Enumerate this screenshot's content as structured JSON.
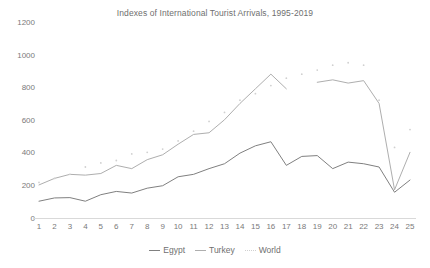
{
  "chart_data": {
    "type": "line",
    "title": "Indexes of International Tourist Arrivals, 1995-2019",
    "xlabel": "",
    "ylabel": "",
    "xlim": [
      1,
      25
    ],
    "ylim": [
      0,
      1200
    ],
    "ytick_step": 200,
    "grid": false,
    "legend_position": "bottom",
    "categories": [
      1,
      2,
      3,
      4,
      5,
      6,
      7,
      8,
      9,
      10,
      11,
      12,
      13,
      14,
      15,
      16,
      17,
      18,
      19,
      20,
      21,
      22,
      23,
      24,
      25
    ],
    "yticks": [
      0,
      200,
      400,
      600,
      800,
      1000,
      1200
    ],
    "ytick_labels": [
      "0",
      "200",
      "400",
      "600",
      "800",
      "1000",
      "1200"
    ],
    "xtick_labels": [
      "1",
      "2",
      "3",
      "4",
      "5",
      "6",
      "7",
      "8",
      "9",
      "10",
      "11",
      "12",
      "13",
      "14",
      "15",
      "16",
      "17",
      "18",
      "19",
      "20",
      "21",
      "22",
      "23",
      "24",
      "25"
    ],
    "series": [
      {
        "name": "Egypt",
        "style": "solid",
        "color": "#808080",
        "values": [
          100,
          120,
          122,
          100,
          140,
          160,
          150,
          180,
          195,
          250,
          265,
          300,
          330,
          395,
          440,
          465,
          320,
          375,
          380,
          300,
          340,
          330,
          310,
          155,
          230
        ]
      },
      {
        "name": "Turkey",
        "style": "solid",
        "color": "#aeaeae",
        "values": [
          200,
          240,
          265,
          260,
          270,
          320,
          300,
          355,
          385,
          450,
          510,
          520,
          600,
          700,
          790,
          880,
          790,
          null,
          830,
          845,
          825,
          840,
          700,
          170,
          400
        ]
      },
      {
        "name": "World",
        "style": "dotted",
        "color": "#d0d0d0",
        "values": [
          215,
          240,
          265,
          310,
          335,
          350,
          390,
          400,
          420,
          470,
          530,
          590,
          645,
          720,
          760,
          810,
          855,
          880,
          905,
          935,
          950,
          935,
          720,
          430,
          540
        ]
      }
    ]
  },
  "legend": {
    "items": [
      {
        "label": "Egypt"
      },
      {
        "label": "Turkey"
      },
      {
        "label": "World"
      }
    ]
  }
}
